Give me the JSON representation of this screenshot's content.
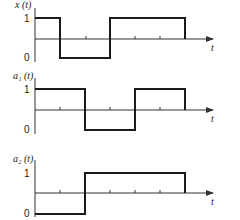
{
  "diagram": {
    "type": "timing-waveforms",
    "panels": [
      {
        "name": "x",
        "ylabel": "x (t)",
        "xlabel": "t",
        "level_high": "1",
        "level_low": "0",
        "segments": [
          {
            "from": 0,
            "to": 1,
            "value": 1
          },
          {
            "from": 1,
            "to": 3,
            "value": 0
          },
          {
            "from": 3,
            "to": 6,
            "value": 1
          }
        ]
      },
      {
        "name": "a1",
        "ylabel": "a₁ (t)",
        "xlabel": "t",
        "level_high": "1",
        "level_low": "0",
        "segments": [
          {
            "from": 0,
            "to": 2,
            "value": 1
          },
          {
            "from": 2,
            "to": 4,
            "value": 0
          },
          {
            "from": 4,
            "to": 6,
            "value": 1
          }
        ]
      },
      {
        "name": "a2",
        "ylabel": "a₂ (t)",
        "xlabel": "t",
        "level_high": "1",
        "level_low": "0",
        "segments": [
          {
            "from": 0,
            "to": 2,
            "value": 0
          },
          {
            "from": 2,
            "to": 6,
            "value": 1
          }
        ]
      }
    ]
  },
  "colors": {
    "line": "#1a1a1a",
    "axis": "#333333"
  }
}
